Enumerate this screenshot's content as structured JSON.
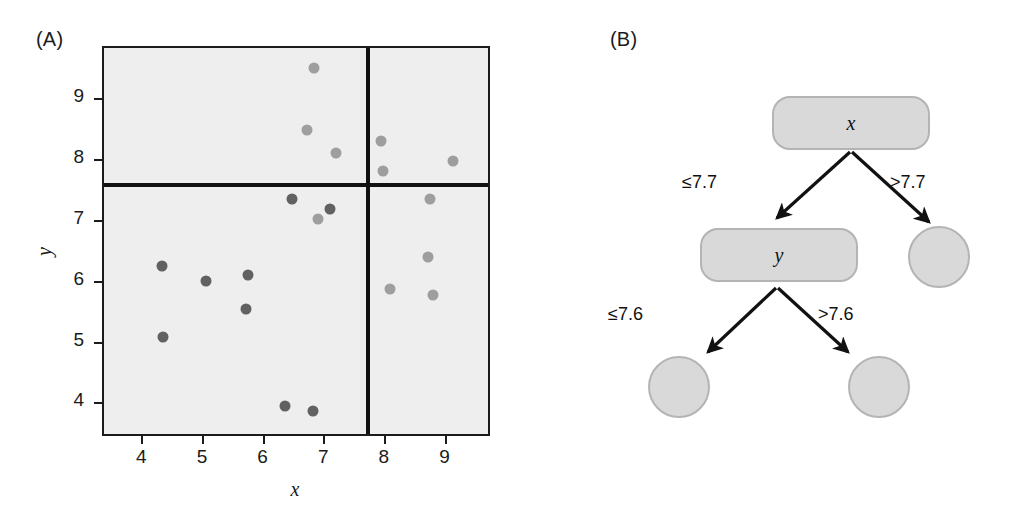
{
  "figure": {
    "panels": [
      {
        "id": "A",
        "label": "(A)"
      },
      {
        "id": "B",
        "label": "(B)"
      }
    ]
  },
  "chart_data": [
    {
      "type": "scatter",
      "panel": "(A)",
      "title": "",
      "xlabel": "x",
      "ylabel": "y",
      "xlim": [
        3.35,
        9.75
      ],
      "ylim": [
        3.45,
        9.85
      ],
      "xticks": [
        4,
        5,
        6,
        7,
        8,
        9
      ],
      "yticks": [
        4,
        5,
        6,
        7,
        8,
        9
      ],
      "grid": false,
      "legend": "none",
      "series": [
        {
          "name": "points",
          "points": [
            {
              "x": 4.3,
              "y": 6.28,
              "shade": "dark"
            },
            {
              "x": 4.32,
              "y": 5.1,
              "shade": "dark"
            },
            {
              "x": 5.03,
              "y": 6.03,
              "shade": "dark"
            },
            {
              "x": 5.72,
              "y": 6.12,
              "shade": "dark"
            },
            {
              "x": 5.7,
              "y": 5.57,
              "shade": "dark"
            },
            {
              "x": 6.33,
              "y": 3.97,
              "shade": "dark"
            },
            {
              "x": 6.8,
              "y": 3.9,
              "shade": "dark"
            },
            {
              "x": 6.45,
              "y": 7.37,
              "shade": "dark"
            },
            {
              "x": 7.08,
              "y": 7.2,
              "shade": "dark"
            },
            {
              "x": 6.88,
              "y": 7.05,
              "shade": "light"
            },
            {
              "x": 6.82,
              "y": 9.52,
              "shade": "light"
            },
            {
              "x": 6.7,
              "y": 8.5,
              "shade": "light"
            },
            {
              "x": 7.18,
              "y": 8.13,
              "shade": "light"
            },
            {
              "x": 7.92,
              "y": 8.33,
              "shade": "light"
            },
            {
              "x": 7.95,
              "y": 7.83,
              "shade": "light"
            },
            {
              "x": 9.1,
              "y": 8.0,
              "shade": "light"
            },
            {
              "x": 8.72,
              "y": 7.38,
              "shade": "light"
            },
            {
              "x": 8.7,
              "y": 6.42,
              "shade": "light"
            },
            {
              "x": 8.07,
              "y": 5.9,
              "shade": "light"
            },
            {
              "x": 8.78,
              "y": 5.8,
              "shade": "light"
            }
          ]
        }
      ],
      "annotations": [
        {
          "kind": "vertical-split-line",
          "value": 7.7,
          "axis": "x"
        },
        {
          "kind": "horizontal-split-line",
          "value": 7.6,
          "axis": "y"
        }
      ]
    }
  ],
  "tree": {
    "panel": "(B)",
    "nodes": [
      {
        "id": "root",
        "shape": "rounded-box",
        "label": "x"
      },
      {
        "id": "inner",
        "shape": "rounded-box",
        "label": "y"
      },
      {
        "id": "leaf-right-top",
        "shape": "circle",
        "label": ""
      },
      {
        "id": "leaf-bottom-left",
        "shape": "circle",
        "label": ""
      },
      {
        "id": "leaf-bottom-right",
        "shape": "circle",
        "label": ""
      }
    ],
    "edges": [
      {
        "from": "root",
        "to": "inner",
        "label": "≤7.7"
      },
      {
        "from": "root",
        "to": "leaf-right-top",
        "label": ">7.7"
      },
      {
        "from": "inner",
        "to": "leaf-bottom-left",
        "label": "≤7.6"
      },
      {
        "from": "inner",
        "to": "leaf-bottom-right",
        "label": ">7.6"
      }
    ]
  },
  "colors": {
    "plot_background": "#eeeeee",
    "frame": "#1b1b1b",
    "split_line": "#111111",
    "dot_dark": "#616161",
    "dot_light": "#9e9e9e",
    "node_fill": "#d9d9d9",
    "node_stroke": "#b4b4b4",
    "edge": "#111111",
    "page_background": "#ffffff"
  }
}
